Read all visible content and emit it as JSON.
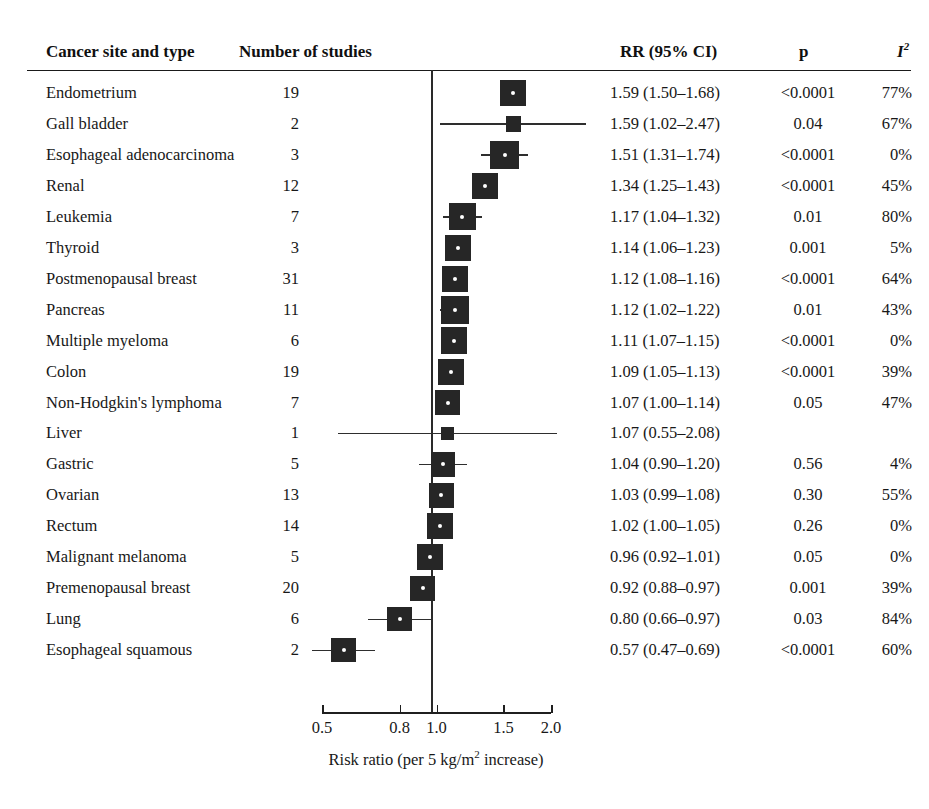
{
  "header": {
    "col_site": "Cancer site and type",
    "col_studies": "Number of studies",
    "col_rr": "RR (95% CI)",
    "col_p": "p",
    "col_i2": "I",
    "col_i2_sup": "2"
  },
  "axis": {
    "title_main": "Risk ratio (per 5 kg/m",
    "title_sup": "2",
    "title_tail": " increase)",
    "ticks": [
      "0.5",
      "0.8",
      "1.0",
      "1.5",
      "2.0"
    ],
    "tick_values": [
      0.5,
      0.8,
      1.0,
      1.5,
      2.0
    ],
    "reference": 1.0,
    "scale": "log",
    "xlim": [
      0.5,
      2.0
    ]
  },
  "chart_data": {
    "type": "forest",
    "title": "",
    "xlabel": "Risk ratio (per 5 kg/m2 increase)",
    "ylabel": "",
    "xlim": [
      0.5,
      2.0
    ],
    "xscale": "log",
    "reference_line": 1.0,
    "grid": false,
    "columns": [
      "Cancer site and type",
      "Number of studies",
      "RR (95% CI)",
      "p",
      "I2"
    ],
    "rows": [
      {
        "site": "Endometrium",
        "studies": "19",
        "rr": 1.59,
        "lo": 1.5,
        "hi": 1.68,
        "rr_text": "1.59 (1.50–1.68)",
        "p": "<0.0001",
        "i2": "77%",
        "weight": 0.8
      },
      {
        "site": "Gall bladder",
        "studies": "2",
        "rr": 1.59,
        "lo": 1.02,
        "hi": 2.47,
        "rr_text": "1.59 (1.02–2.47)",
        "p": "0.04",
        "i2": "67%",
        "weight": 0.26
      },
      {
        "site": "Esophageal adenocarcinoma",
        "studies": "3",
        "rr": 1.51,
        "lo": 1.31,
        "hi": 1.74,
        "rr_text": "1.51 (1.31–1.74)",
        "p": "<0.0001",
        "i2": "0%",
        "weight": 0.92
      },
      {
        "site": "Renal",
        "studies": "12",
        "rr": 1.34,
        "lo": 1.25,
        "hi": 1.43,
        "rr_text": "1.34 (1.25–1.43)",
        "p": "<0.0001",
        "i2": "45%",
        "weight": 0.82
      },
      {
        "site": "Leukemia",
        "studies": "7",
        "rr": 1.17,
        "lo": 1.04,
        "hi": 1.32,
        "rr_text": "1.17 (1.04–1.32)",
        "p": "0.01",
        "i2": "80%",
        "weight": 0.85
      },
      {
        "site": "Thyroid",
        "studies": "3",
        "rr": 1.14,
        "lo": 1.06,
        "hi": 1.23,
        "rr_text": "1.14 (1.06–1.23)",
        "p": "0.001",
        "i2": "5%",
        "weight": 0.78
      },
      {
        "site": "Postmenopausal breast",
        "studies": "31",
        "rr": 1.12,
        "lo": 1.08,
        "hi": 1.16,
        "rr_text": "1.12 (1.08–1.16)",
        "p": "<0.0001",
        "i2": "64%",
        "weight": 0.8
      },
      {
        "site": "Pancreas",
        "studies": "11",
        "rr": 1.12,
        "lo": 1.02,
        "hi": 1.22,
        "rr_text": "1.12 (1.02–1.22)",
        "p": "0.01",
        "i2": "43%",
        "weight": 0.9
      },
      {
        "site": "Multiple myeloma",
        "studies": "6",
        "rr": 1.11,
        "lo": 1.07,
        "hi": 1.15,
        "rr_text": "1.11 (1.07–1.15)",
        "p": "<0.0001",
        "i2": "0%",
        "weight": 0.82
      },
      {
        "site": "Colon",
        "studies": "19",
        "rr": 1.09,
        "lo": 1.05,
        "hi": 1.13,
        "rr_text": "1.09 (1.05–1.13)",
        "p": "<0.0001",
        "i2": "39%",
        "weight": 0.8
      },
      {
        "site": "Non-Hodgkin's lymphoma",
        "studies": "7",
        "rr": 1.07,
        "lo": 1.0,
        "hi": 1.14,
        "rr_text": "1.07 (1.00–1.14)",
        "p": "0.05",
        "i2": "47%",
        "weight": 0.78
      },
      {
        "site": "Liver",
        "studies": "1",
        "rr": 1.07,
        "lo": 0.55,
        "hi": 2.08,
        "rr_text": "1.07 (0.55–2.08)",
        "p": "",
        "i2": "",
        "weight": 0.14
      },
      {
        "site": "Gastric",
        "studies": "5",
        "rr": 1.04,
        "lo": 0.9,
        "hi": 1.2,
        "rr_text": "1.04 (0.90–1.20)",
        "p": "0.56",
        "i2": "4%",
        "weight": 0.74
      },
      {
        "site": "Ovarian",
        "studies": "13",
        "rr": 1.03,
        "lo": 0.99,
        "hi": 1.08,
        "rr_text": "1.03 (0.99–1.08)",
        "p": "0.30",
        "i2": "55%",
        "weight": 0.76
      },
      {
        "site": "Rectum",
        "studies": "14",
        "rr": 1.02,
        "lo": 1.0,
        "hi": 1.05,
        "rr_text": "1.02 (1.00–1.05)",
        "p": "0.26",
        "i2": "0%",
        "weight": 0.8
      },
      {
        "site": "Malignant melanoma",
        "studies": "5",
        "rr": 0.96,
        "lo": 0.92,
        "hi": 1.01,
        "rr_text": "0.96 (0.92–1.01)",
        "p": "0.05",
        "i2": "0%",
        "weight": 0.78
      },
      {
        "site": "Premenopausal breast",
        "studies": "20",
        "rr": 0.92,
        "lo": 0.88,
        "hi": 0.97,
        "rr_text": "0.92 (0.88–0.97)",
        "p": "0.001",
        "i2": "39%",
        "weight": 0.76
      },
      {
        "site": "Lung",
        "studies": "6",
        "rr": 0.8,
        "lo": 0.66,
        "hi": 0.97,
        "rr_text": "0.80 (0.66–0.97)",
        "p": "0.03",
        "i2": "84%",
        "weight": 0.72
      },
      {
        "site": "Esophageal squamous",
        "studies": "2",
        "rr": 0.57,
        "lo": 0.47,
        "hi": 0.69,
        "rr_text": "0.57 (0.47–0.69)",
        "p": "<0.0001",
        "i2": "60%",
        "weight": 0.72
      }
    ]
  }
}
